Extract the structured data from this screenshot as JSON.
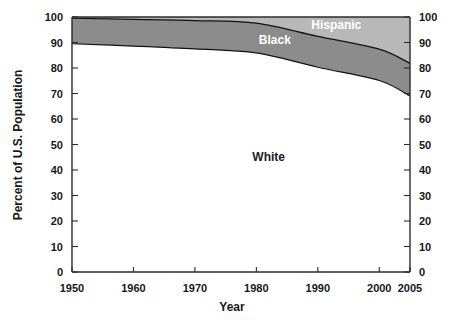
{
  "chart_data": {
    "type": "area",
    "title": "",
    "xlabel": "Year",
    "ylabel": "Percent of U.S. Population",
    "xlim": [
      1950,
      2005
    ],
    "ylim": [
      0,
      100
    ],
    "grid": false,
    "stacked": true,
    "legend": "inline-labels",
    "x": [
      1950,
      1960,
      1970,
      1980,
      1990,
      2000,
      2005
    ],
    "xticks": [
      "1950",
      "1960",
      "1970",
      "1980",
      "1990",
      "2000",
      "2005"
    ],
    "yticks": [
      "0",
      "10",
      "20",
      "30",
      "40",
      "50",
      "60",
      "70",
      "80",
      "90",
      "100"
    ],
    "series": [
      {
        "name": "White",
        "color": "#ffffff",
        "label_x": 1982,
        "label_y": 45,
        "values": [
          89.5,
          88.6,
          87.5,
          85.9,
          80.3,
          75.1,
          69.0
        ]
      },
      {
        "name": "Black",
        "color": "#8c8c8c",
        "label_x": 1983,
        "label_y": 91,
        "values": [
          10.0,
          10.5,
          11.1,
          11.7,
          12.1,
          12.3,
          12.8
        ]
      },
      {
        "name": "Hispanic",
        "color": "#b8b8b8",
        "label_x": 1993,
        "label_y": 97,
        "values": [
          0.5,
          0.9,
          1.4,
          2.4,
          7.6,
          12.6,
          18.2
        ]
      }
    ],
    "cumulative_white_top": [
      89.5,
      88.6,
      87.5,
      85.9,
      80.3,
      75.1,
      69.0
    ],
    "cumulative_black_top": [
      99.5,
      99.1,
      98.6,
      97.6,
      92.4,
      87.4,
      81.8
    ],
    "cumulative_hispanic_top": [
      100,
      100,
      100,
      100,
      100,
      100,
      100
    ]
  },
  "axes": {
    "left_axis_name": "left-y-axis",
    "right_axis_name": "right-y-axis",
    "bottom_axis_name": "x-axis"
  }
}
